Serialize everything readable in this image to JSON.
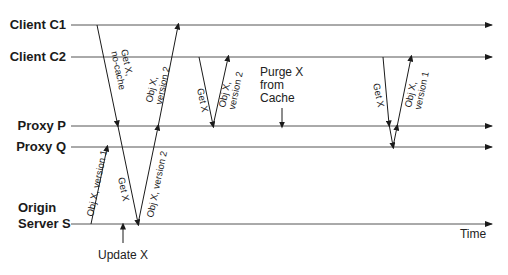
{
  "diagram": {
    "type": "sequence/timeline diagram",
    "colors": {
      "line": "#555555",
      "text": "#1a1a1a"
    },
    "entities": [
      {
        "id": "c1",
        "label": "Client C1",
        "y": 25
      },
      {
        "id": "c2",
        "label": "Client C2",
        "y": 57
      },
      {
        "id": "p",
        "label": "Proxy P",
        "y": 126
      },
      {
        "id": "q",
        "label": "Proxy Q",
        "y": 147
      },
      {
        "id": "s",
        "label_line1": "Origin",
        "label_line2": "Server S",
        "y": 224
      }
    ],
    "axis_label": "Time",
    "messages": [
      {
        "id": "m1",
        "line1": "Get X,",
        "line2": "no-cache",
        "from": "Client C1",
        "to": "Origin Server S"
      },
      {
        "id": "m2",
        "line1": "Obj X,",
        "line2": "version 2",
        "from": "Origin Server S",
        "to": "Client C1"
      },
      {
        "id": "m3",
        "line1": "Obj X, version 1",
        "from": "Origin Server S",
        "to": "Proxy Q"
      },
      {
        "id": "m4",
        "line1": "Get X",
        "from": "Proxy P",
        "to": "Origin Server S"
      },
      {
        "id": "m5",
        "line1": "Obj X, version 2",
        "from": "Origin Server S",
        "to": "Proxy P"
      },
      {
        "id": "m6",
        "line1": "Get X",
        "from": "Client C2",
        "to": "Proxy P"
      },
      {
        "id": "m7",
        "line1": "Obj X,",
        "line2": "version 2",
        "from": "Proxy P",
        "to": "Client C2"
      },
      {
        "id": "m8",
        "line1": "Get X",
        "from": "Client C2",
        "to": "Proxy Q"
      },
      {
        "id": "m9",
        "line1": "Obj X,",
        "line2": "version 1",
        "from": "Proxy Q",
        "to": "Client C2"
      }
    ],
    "events": [
      {
        "id": "purge",
        "line1": "Purge X",
        "line2": "from",
        "line3": "Cache",
        "target": "Proxy P"
      },
      {
        "id": "update",
        "label": "Update X",
        "target": "Origin Server S"
      }
    ]
  }
}
